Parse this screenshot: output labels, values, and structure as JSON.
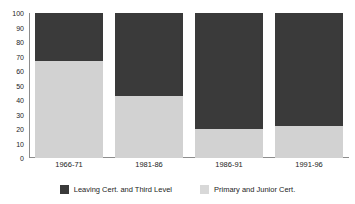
{
  "chart_data": {
    "type": "bar",
    "subtype": "stacked-100-percent",
    "title": "",
    "subtitle": "",
    "xlabel": "",
    "ylabel": "",
    "ylim": [
      0,
      100
    ],
    "yticks": [
      0,
      10,
      20,
      30,
      40,
      50,
      60,
      70,
      80,
      90,
      100
    ],
    "ytick_labels": [
      "0",
      "10",
      "20",
      "30",
      "40",
      "50",
      "60",
      "70",
      "80",
      "90",
      "100"
    ],
    "grid": false,
    "legend_position": "bottom",
    "categories": [
      "1966-71",
      "1981-86",
      "1986-91",
      "1991-96"
    ],
    "series": [
      {
        "name": "Leaving Cert. and Third Level",
        "color": "#3a3a3a",
        "values": [
          33,
          57,
          80,
          78
        ]
      },
      {
        "name": "Primary and Junior Cert.",
        "color": "#d2d2d2",
        "values": [
          67,
          43,
          20,
          22
        ]
      }
    ],
    "stack_order": [
      "Primary and Junior Cert.",
      "Leaving Cert. and Third Level"
    ]
  },
  "axes": {
    "y_ticks": [
      {
        "label": "100",
        "value": 100
      },
      {
        "label": "90",
        "value": 90
      },
      {
        "label": "80",
        "value": 80
      },
      {
        "label": "70",
        "value": 70
      },
      {
        "label": "60",
        "value": 60
      },
      {
        "label": "50",
        "value": 50
      },
      {
        "label": "40",
        "value": 40
      },
      {
        "label": "30",
        "value": 30
      },
      {
        "label": "20",
        "value": 20
      },
      {
        "label": "10",
        "value": 10
      },
      {
        "label": "0",
        "value": 0
      }
    ],
    "x_ticks": [
      {
        "label": "1966-71"
      },
      {
        "label": "1981-86"
      },
      {
        "label": "1986-91"
      },
      {
        "label": "1991-96"
      }
    ]
  },
  "bars": [
    {
      "category": "1966-71",
      "dark": 33,
      "light": 67
    },
    {
      "category": "1981-86",
      "dark": 57,
      "light": 43
    },
    {
      "category": "1986-91",
      "dark": 80,
      "light": 20
    },
    {
      "category": "1991-96",
      "dark": 78,
      "light": 22
    }
  ],
  "legend": {
    "items": [
      {
        "label": "Leaving Cert. and Third Level",
        "color": "#3a3a3a",
        "swatch_name": "dark"
      },
      {
        "label": "Primary and Junior Cert.",
        "color": "#d8d8d8",
        "swatch_name": "light"
      }
    ]
  },
  "colors": {
    "dark_series": "#3a3a3a",
    "light_series": "#d2d2d2",
    "axis": "#8c8c8c",
    "text": "#242424",
    "background": "#ffffff"
  }
}
